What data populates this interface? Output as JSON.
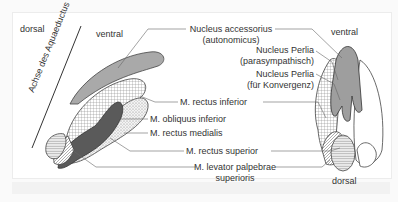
{
  "diagram": {
    "orientation": {
      "left_dorsal": "dorsal",
      "left_ventral": "ventral",
      "right_ventral": "ventral",
      "right_dorsal": "dorsal",
      "axis": "Achse des Aquaeductus"
    },
    "labels": {
      "nucleus_accessorius_1": "Nucleus accessorius",
      "nucleus_accessorius_2": "(autonomicus)",
      "perlia_para_1": "Nucleus Perlia",
      "perlia_para_2": "(parasympathisch)",
      "perlia_konv_1": "Nucleus Perlia",
      "perlia_konv_2": "(für Konvergenz)",
      "rectus_inferior": "M. rectus inferior",
      "obliquus_inferior": "M. obliquus inferior",
      "rectus_medialis": "M. rectus medialis",
      "rectus_superior": "M. rectus superior",
      "levator_1": "M. levator palpebrae",
      "levator_2": "superioris"
    },
    "colors": {
      "accessorius_fill": "#a9a9a9",
      "medialis_fill": "#5a5a5a",
      "outline": "#444444",
      "leader": "#666666"
    }
  }
}
